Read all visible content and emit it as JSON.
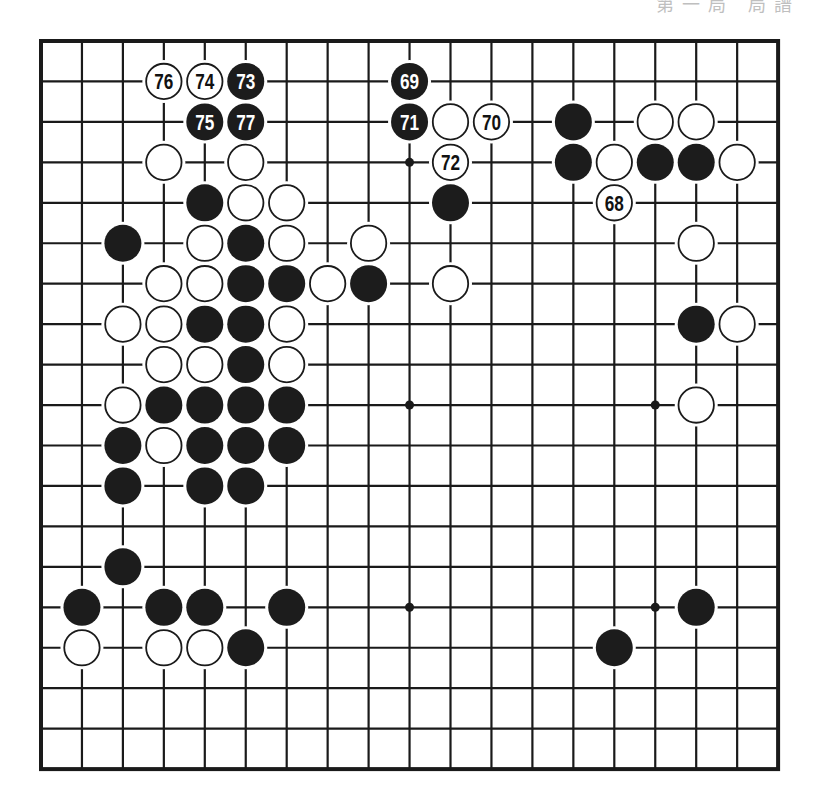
{
  "header": {
    "fragment": "第一局 局譜"
  },
  "board": {
    "size": 19,
    "origin_x": 41,
    "origin_y": 41,
    "step_x": 40.95,
    "step_y": 40.45,
    "frame_color": "#1a1a1a",
    "line_color": "#1a1a1a",
    "black_color": "#1c1c1c",
    "white_color": "#ffffff",
    "star_points": [
      [
        9,
        3
      ],
      [
        9,
        9
      ],
      [
        15,
        9
      ],
      [
        9,
        14
      ],
      [
        15,
        14
      ]
    ],
    "stones": [
      {
        "c": 3,
        "r": 1,
        "color": "white",
        "label": "76"
      },
      {
        "c": 4,
        "r": 1,
        "color": "white",
        "label": "74"
      },
      {
        "c": 5,
        "r": 1,
        "color": "black",
        "label": "73"
      },
      {
        "c": 9,
        "r": 1,
        "color": "black",
        "label": "69"
      },
      {
        "c": 4,
        "r": 2,
        "color": "black",
        "label": "75"
      },
      {
        "c": 5,
        "r": 2,
        "color": "black",
        "label": "77"
      },
      {
        "c": 9,
        "r": 2,
        "color": "black",
        "label": "71"
      },
      {
        "c": 10,
        "r": 2,
        "color": "white",
        "label": ""
      },
      {
        "c": 11,
        "r": 2,
        "color": "white",
        "label": "70"
      },
      {
        "c": 13,
        "r": 2,
        "color": "black",
        "label": ""
      },
      {
        "c": 15,
        "r": 2,
        "color": "white",
        "label": ""
      },
      {
        "c": 16,
        "r": 2,
        "color": "white",
        "label": ""
      },
      {
        "c": 3,
        "r": 3,
        "color": "white",
        "label": ""
      },
      {
        "c": 5,
        "r": 3,
        "color": "white",
        "label": ""
      },
      {
        "c": 10,
        "r": 3,
        "color": "white",
        "label": "72"
      },
      {
        "c": 13,
        "r": 3,
        "color": "black",
        "label": ""
      },
      {
        "c": 14,
        "r": 3,
        "color": "white",
        "label": ""
      },
      {
        "c": 15,
        "r": 3,
        "color": "black",
        "label": ""
      },
      {
        "c": 16,
        "r": 3,
        "color": "black",
        "label": ""
      },
      {
        "c": 17,
        "r": 3,
        "color": "white",
        "label": ""
      },
      {
        "c": 4,
        "r": 4,
        "color": "black",
        "label": ""
      },
      {
        "c": 5,
        "r": 4,
        "color": "white",
        "label": ""
      },
      {
        "c": 6,
        "r": 4,
        "color": "white",
        "label": ""
      },
      {
        "c": 10,
        "r": 4,
        "color": "black",
        "label": ""
      },
      {
        "c": 14,
        "r": 4,
        "color": "white",
        "label": "68"
      },
      {
        "c": 2,
        "r": 5,
        "color": "black",
        "label": ""
      },
      {
        "c": 4,
        "r": 5,
        "color": "white",
        "label": ""
      },
      {
        "c": 5,
        "r": 5,
        "color": "black",
        "label": ""
      },
      {
        "c": 6,
        "r": 5,
        "color": "white",
        "label": ""
      },
      {
        "c": 8,
        "r": 5,
        "color": "white",
        "label": ""
      },
      {
        "c": 16,
        "r": 5,
        "color": "white",
        "label": ""
      },
      {
        "c": 3,
        "r": 6,
        "color": "white",
        "label": ""
      },
      {
        "c": 4,
        "r": 6,
        "color": "white",
        "label": ""
      },
      {
        "c": 5,
        "r": 6,
        "color": "black",
        "label": ""
      },
      {
        "c": 6,
        "r": 6,
        "color": "black",
        "label": ""
      },
      {
        "c": 7,
        "r": 6,
        "color": "white",
        "label": ""
      },
      {
        "c": 8,
        "r": 6,
        "color": "black",
        "label": ""
      },
      {
        "c": 10,
        "r": 6,
        "color": "white",
        "label": ""
      },
      {
        "c": 2,
        "r": 7,
        "color": "white",
        "label": ""
      },
      {
        "c": 3,
        "r": 7,
        "color": "white",
        "label": ""
      },
      {
        "c": 4,
        "r": 7,
        "color": "black",
        "label": ""
      },
      {
        "c": 5,
        "r": 7,
        "color": "black",
        "label": ""
      },
      {
        "c": 6,
        "r": 7,
        "color": "white",
        "label": ""
      },
      {
        "c": 16,
        "r": 7,
        "color": "black",
        "label": ""
      },
      {
        "c": 17,
        "r": 7,
        "color": "white",
        "label": ""
      },
      {
        "c": 3,
        "r": 8,
        "color": "white",
        "label": ""
      },
      {
        "c": 4,
        "r": 8,
        "color": "white",
        "label": ""
      },
      {
        "c": 5,
        "r": 8,
        "color": "black",
        "label": ""
      },
      {
        "c": 6,
        "r": 8,
        "color": "white",
        "label": ""
      },
      {
        "c": 2,
        "r": 9,
        "color": "white",
        "label": ""
      },
      {
        "c": 3,
        "r": 9,
        "color": "black",
        "label": ""
      },
      {
        "c": 4,
        "r": 9,
        "color": "black",
        "label": ""
      },
      {
        "c": 5,
        "r": 9,
        "color": "black",
        "label": ""
      },
      {
        "c": 6,
        "r": 9,
        "color": "black",
        "label": ""
      },
      {
        "c": 16,
        "r": 9,
        "color": "white",
        "label": ""
      },
      {
        "c": 2,
        "r": 10,
        "color": "black",
        "label": ""
      },
      {
        "c": 3,
        "r": 10,
        "color": "white",
        "label": ""
      },
      {
        "c": 4,
        "r": 10,
        "color": "black",
        "label": ""
      },
      {
        "c": 5,
        "r": 10,
        "color": "black",
        "label": ""
      },
      {
        "c": 6,
        "r": 10,
        "color": "black",
        "label": ""
      },
      {
        "c": 2,
        "r": 11,
        "color": "black",
        "label": ""
      },
      {
        "c": 4,
        "r": 11,
        "color": "black",
        "label": ""
      },
      {
        "c": 5,
        "r": 11,
        "color": "black",
        "label": ""
      },
      {
        "c": 2,
        "r": 13,
        "color": "black",
        "label": ""
      },
      {
        "c": 1,
        "r": 14,
        "color": "black",
        "label": ""
      },
      {
        "c": 3,
        "r": 14,
        "color": "black",
        "label": ""
      },
      {
        "c": 4,
        "r": 14,
        "color": "black",
        "label": ""
      },
      {
        "c": 6,
        "r": 14,
        "color": "black",
        "label": ""
      },
      {
        "c": 16,
        "r": 14,
        "color": "black",
        "label": ""
      },
      {
        "c": 1,
        "r": 15,
        "color": "white",
        "label": ""
      },
      {
        "c": 3,
        "r": 15,
        "color": "white",
        "label": ""
      },
      {
        "c": 4,
        "r": 15,
        "color": "white",
        "label": ""
      },
      {
        "c": 5,
        "r": 15,
        "color": "black",
        "label": ""
      },
      {
        "c": 14,
        "r": 15,
        "color": "black",
        "label": ""
      }
    ]
  }
}
